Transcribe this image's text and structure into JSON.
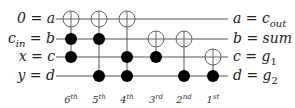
{
  "diagram": {
    "type": "reversible-circuit",
    "wires": [
      {
        "left": "0 = a",
        "right": "a = c_out",
        "y": 19
      },
      {
        "left": "c_in = b",
        "right": "b = sum",
        "y": 39
      },
      {
        "left": "x = c",
        "right": "c = g1",
        "y": 57
      },
      {
        "left": "y = d",
        "right": "d = g2",
        "y": 76
      }
    ],
    "gates": [
      {
        "order": "6th",
        "x": 71,
        "target": 0,
        "controls": [
          1,
          2
        ]
      },
      {
        "order": "5th",
        "x": 99,
        "target": 0,
        "controls": [
          1,
          3
        ]
      },
      {
        "order": "4th",
        "x": 127,
        "target": 0,
        "controls": [
          2,
          3
        ]
      },
      {
        "order": "3rd",
        "x": 156,
        "target": 1,
        "controls": [
          2
        ]
      },
      {
        "order": "2nd",
        "x": 184,
        "target": 1,
        "controls": [
          3
        ]
      },
      {
        "order": "1st",
        "x": 213,
        "target": 2,
        "controls": [
          3
        ]
      }
    ],
    "order_labels": [
      {
        "num": "6",
        "sup": "th"
      },
      {
        "num": "5",
        "sup": "th"
      },
      {
        "num": "4",
        "sup": "th"
      },
      {
        "num": "3",
        "sup": "rd"
      },
      {
        "num": "2",
        "sup": "nd"
      },
      {
        "num": "1",
        "sup": "st"
      }
    ],
    "left_labels": {
      "w0": {
        "main": "0 = a",
        "sub": ""
      },
      "w1": {
        "main": "c",
        "sub": "in",
        "rest": " = b"
      },
      "w2": {
        "main": "x = c",
        "sub": ""
      },
      "w3": {
        "main": "y = d",
        "sub": ""
      }
    },
    "right_labels": {
      "w0": {
        "main": "a = c",
        "sub": "out"
      },
      "w1": {
        "main": "b = sum",
        "sub": ""
      },
      "w2": {
        "main": "c = g",
        "sub": "1"
      },
      "w3": {
        "main": "d = g",
        "sub": "2"
      }
    }
  }
}
